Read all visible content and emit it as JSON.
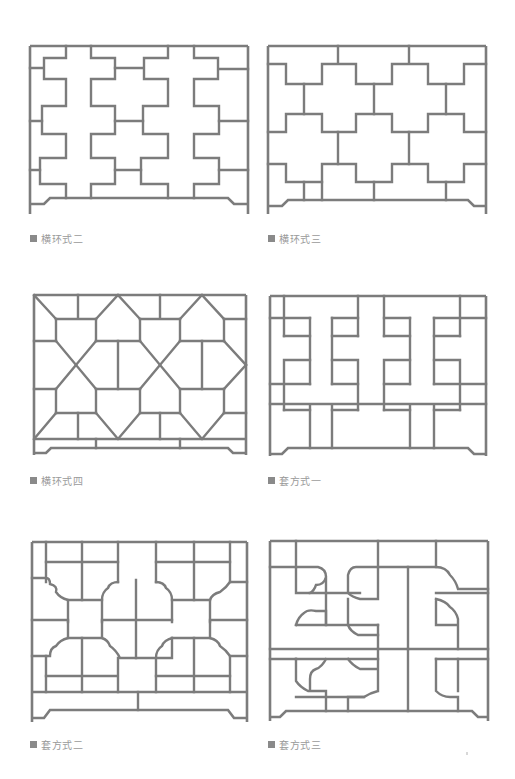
{
  "page": {
    "background": "#ffffff",
    "line_color": "#7c7c7c",
    "caption_color": "#9a9a9a"
  },
  "figures": [
    {
      "id": "fig1",
      "caption": "横环式二",
      "x": 30,
      "y": 46,
      "w": 218,
      "h": 168,
      "cap_x": 30,
      "cap_y": 231
    },
    {
      "id": "fig2",
      "caption": "横环式三",
      "x": 268,
      "y": 46,
      "w": 218,
      "h": 168,
      "cap_x": 268,
      "cap_y": 231
    },
    {
      "id": "fig3",
      "caption": "横环式四",
      "x": 34,
      "y": 295,
      "w": 212,
      "h": 162,
      "cap_x": 30,
      "cap_y": 473
    },
    {
      "id": "fig4",
      "caption": "套方式一",
      "x": 270,
      "y": 296,
      "w": 216,
      "h": 160,
      "cap_x": 268,
      "cap_y": 473
    },
    {
      "id": "fig5",
      "caption": "套方式二",
      "x": 32,
      "y": 542,
      "w": 215,
      "h": 180,
      "cap_x": 30,
      "cap_y": 737
    },
    {
      "id": "fig6",
      "caption": "套方式三",
      "x": 270,
      "y": 541,
      "w": 218,
      "h": 180,
      "cap_x": 268,
      "cap_y": 737
    }
  ]
}
